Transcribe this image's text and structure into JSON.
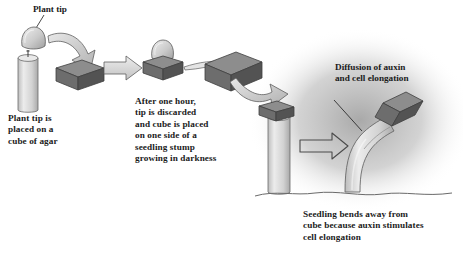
{
  "figure": {
    "title_visible": false,
    "background": "#ffffff",
    "ink": "#1b1b1b"
  },
  "panels": [
    {
      "id": "panel-one",
      "label": {
        "name": "plant-tip-label",
        "text": "Plant tip"
      },
      "caption": "Plant tip is\nplaced on a\ncube of agar",
      "objects": [
        "plant-tip-dome",
        "seedling-stump-cylinder",
        "agar-cube",
        "transfer-arrow"
      ]
    },
    {
      "id": "panel-two",
      "caption": "After one hour,\ntip is discarded\nand cube is placed\non one side of a\nseedling stump\ngrowing in darkness",
      "objects": [
        "plant-tip-dome",
        "agar-cube",
        "sliver-arrow",
        "curved-arrow",
        "block-arrow"
      ]
    },
    {
      "id": "panel-three",
      "label": {
        "name": "diffusion-label",
        "text": "Diffusion of auxin\nand cell elongation"
      },
      "caption": "Seedling bends away from\ncube because auxin stimulates\ncell elongation",
      "objects": [
        "darkness-shading",
        "straight-stump",
        "agar-cube",
        "bent-seedling",
        "tilted-cube",
        "ground-line",
        "result-arrow"
      ]
    }
  ],
  "colors": {
    "cube_top": "#8f8f8f",
    "cube_front": "#6e6e6e",
    "cube_side": "#565656",
    "stem_light": "#e3e3e3",
    "stem_mid": "#c9c9c9",
    "arrow_fill": "#d4d4d4",
    "outline": "#4a4a4a",
    "darkness": "#9a9a9a"
  }
}
